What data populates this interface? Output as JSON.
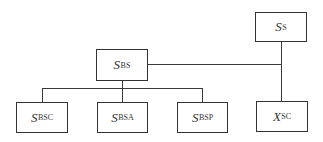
{
  "nodes": {
    "ss": {
      "symbol": "S",
      "subscript": "S"
    },
    "sbs": {
      "symbol": "S",
      "subscript": "BS"
    },
    "sbsc": {
      "symbol": "S",
      "subscript": "BSC"
    },
    "sbsa": {
      "symbol": "S",
      "subscript": "BSA"
    },
    "sbsp": {
      "symbol": "S",
      "subscript": "BSP"
    },
    "xsc": {
      "symbol": "X",
      "subscript": "SC"
    }
  },
  "edges": [
    {
      "from": "ss",
      "to": "sbs"
    },
    {
      "from": "ss",
      "to": "xsc"
    },
    {
      "from": "sbs",
      "to": "sbsc"
    },
    {
      "from": "sbs",
      "to": "sbsa"
    },
    {
      "from": "sbs",
      "to": "sbsp"
    }
  ]
}
